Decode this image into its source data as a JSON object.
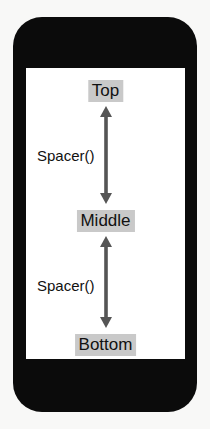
{
  "diagram": {
    "title_context": "SwiftUI VStack Spacer layout illustration",
    "device": {
      "name": "phone-mockup",
      "frame_color": "#0b0b0b",
      "screen_color": "#ffffff",
      "background_color": "#f8f8f7"
    },
    "highlight_color": "#c9c9c9",
    "arrow_color": "#555555",
    "text_color": "#111111",
    "labels": [
      {
        "id": "top",
        "text": "Top"
      },
      {
        "id": "middle",
        "text": "Middle"
      },
      {
        "id": "bottom",
        "text": "Bottom"
      }
    ],
    "spacers": [
      {
        "id": "spacer-1",
        "text": "Spacer()",
        "icon": "double-headed-vertical-arrow-icon"
      },
      {
        "id": "spacer-2",
        "text": "Spacer()",
        "icon": "double-headed-vertical-arrow-icon"
      }
    ]
  }
}
